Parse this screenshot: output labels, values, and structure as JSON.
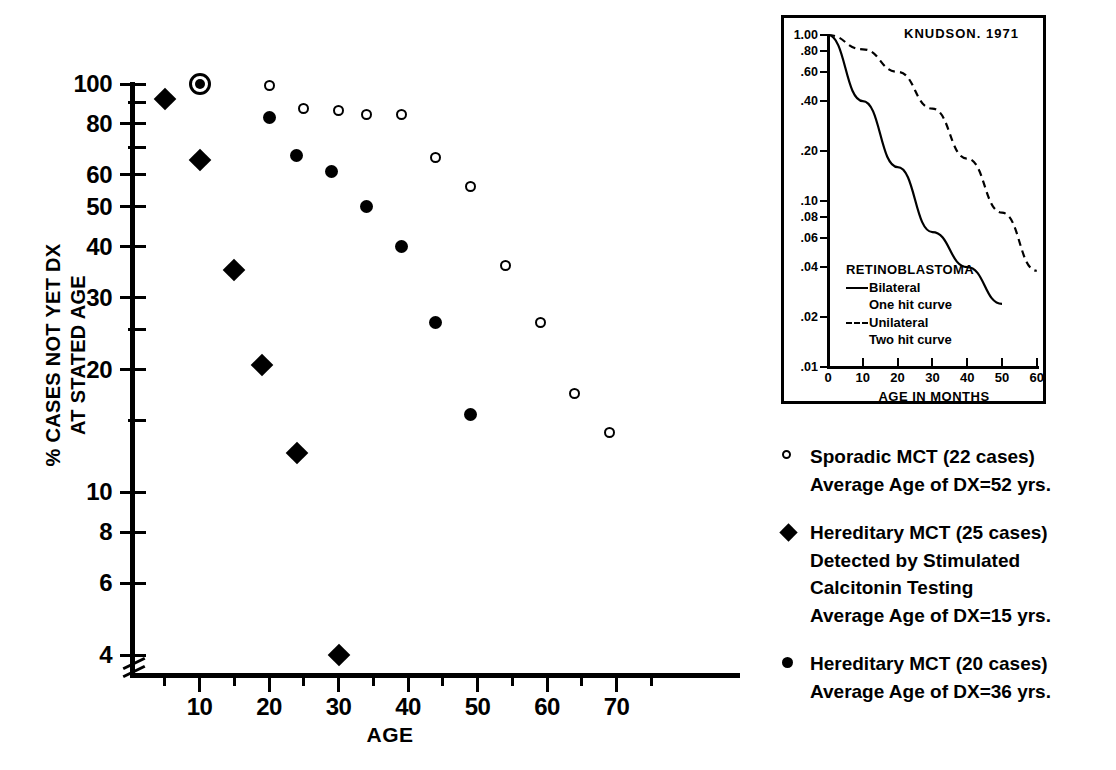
{
  "chart_data": {
    "type": "scatter",
    "title": "",
    "xlabel": "AGE",
    "ylabel": "% CASES NOT YET DX AT STATED AGE",
    "ylabel_lines": [
      "% CASES NOT YET DX",
      "AT STATED AGE"
    ],
    "yscale": "log",
    "ylim": [
      4,
      100
    ],
    "xlim": [
      0,
      75
    ],
    "grid": false,
    "xticks": [
      10,
      20,
      30,
      40,
      50,
      60,
      70
    ],
    "xticklabels": [
      "10",
      "20",
      "30",
      "40",
      "50",
      "60",
      "70"
    ],
    "xminorticks": [
      5,
      15,
      25,
      35,
      45,
      55,
      65,
      75
    ],
    "yticks": [
      100,
      80,
      60,
      50,
      40,
      30,
      20,
      10,
      8,
      6,
      4
    ],
    "yticklabels": [
      "100",
      "80",
      "60",
      "50",
      "40",
      "30",
      "20",
      "10",
      "8",
      "6",
      "4"
    ],
    "yminorticks": [
      90,
      70,
      25,
      15
    ],
    "axis_break_y": true,
    "legend_position": "right",
    "series": [
      {
        "name": "Sporadic MCT (22 cases)",
        "marker": "open-circle",
        "points": [
          {
            "x": 10,
            "y": 100
          },
          {
            "x": 20,
            "y": 99
          },
          {
            "x": 25,
            "y": 87
          },
          {
            "x": 30,
            "y": 86
          },
          {
            "x": 34,
            "y": 84
          },
          {
            "x": 39,
            "y": 84
          },
          {
            "x": 44,
            "y": 66
          },
          {
            "x": 49,
            "y": 56
          },
          {
            "x": 54,
            "y": 36
          },
          {
            "x": 59,
            "y": 26
          },
          {
            "x": 64,
            "y": 17.5
          },
          {
            "x": 69,
            "y": 14
          }
        ]
      },
      {
        "name": "Hereditary MCT (25 cases) Detected by Stimulated Calcitonin Testing",
        "marker": "diamond",
        "points": [
          {
            "x": 5,
            "y": 92
          },
          {
            "x": 10,
            "y": 65
          },
          {
            "x": 15,
            "y": 35
          },
          {
            "x": 19,
            "y": 20.5
          },
          {
            "x": 24,
            "y": 12.5
          },
          {
            "x": 30,
            "y": 4
          }
        ]
      },
      {
        "name": "Hereditary MCT (20 cases)",
        "marker": "filled-circle",
        "points": [
          {
            "x": 10,
            "y": 100
          },
          {
            "x": 20,
            "y": 83
          },
          {
            "x": 24,
            "y": 67
          },
          {
            "x": 29,
            "y": 61
          },
          {
            "x": 34,
            "y": 50
          },
          {
            "x": 39,
            "y": 40
          },
          {
            "x": 44,
            "y": 26
          },
          {
            "x": 49,
            "y": 15.5
          }
        ]
      }
    ]
  },
  "legend": {
    "entries": [
      {
        "marker": "open-circle",
        "lines": [
          "Sporadic MCT (22 cases)",
          "Average Age of DX=52 yrs."
        ]
      },
      {
        "marker": "diamond",
        "lines": [
          "Hereditary MCT (25 cases)",
          "Detected by Stimulated",
          "Calcitonin Testing",
          "Average Age of DX=15 yrs."
        ]
      },
      {
        "marker": "filled-circle",
        "lines": [
          "Hereditary MCT (20 cases)",
          "Average Age of  DX=36 yrs."
        ]
      }
    ]
  },
  "inset": {
    "title": "KNUDSON.  1971",
    "xlabel": "AGE  IN  MONTHS",
    "yscale": "log",
    "yticklabels": [
      "1.00",
      ".80",
      ".60",
      ".40",
      ".20",
      ".10",
      ".08",
      ".06",
      ".04",
      ".02",
      ".01"
    ],
    "yticks": [
      1.0,
      0.8,
      0.6,
      0.4,
      0.2,
      0.1,
      0.08,
      0.06,
      0.04,
      0.02,
      0.01
    ],
    "xticklabels": [
      "0",
      "10",
      "20",
      "30",
      "40",
      "50",
      "60"
    ],
    "xticks": [
      0,
      10,
      20,
      30,
      40,
      50,
      60
    ],
    "legend": {
      "header": "RETINOBLASTOMA",
      "items": [
        {
          "style": "solid",
          "label": "Bilateral",
          "sub": "One  hit  curve"
        },
        {
          "style": "dashed",
          "label": "Unilateral",
          "sub": "Two  hit  curve"
        }
      ]
    },
    "curves": [
      {
        "name": "Bilateral one hit curve",
        "style": "solid",
        "points": [
          [
            0,
            1.0
          ],
          [
            10,
            0.4
          ],
          [
            20,
            0.16
          ],
          [
            30,
            0.065
          ],
          [
            40,
            0.04
          ],
          [
            50,
            0.024
          ]
        ]
      },
      {
        "name": "Unilateral two hit curve",
        "style": "dashed",
        "points": [
          [
            0,
            1.0
          ],
          [
            10,
            0.82
          ],
          [
            20,
            0.6
          ],
          [
            30,
            0.36
          ],
          [
            40,
            0.18
          ],
          [
            50,
            0.085
          ],
          [
            60,
            0.038
          ]
        ]
      }
    ]
  },
  "colors": {
    "ink": "#000000",
    "paper": "#ffffff"
  }
}
